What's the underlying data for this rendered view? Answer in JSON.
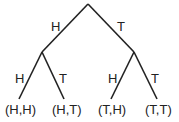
{
  "diagram": {
    "type": "probability-tree",
    "edges": [
      {
        "from": "root",
        "to": "H",
        "label": "H"
      },
      {
        "from": "root",
        "to": "T",
        "label": "T"
      },
      {
        "from": "H",
        "to": "HH",
        "label": "H"
      },
      {
        "from": "H",
        "to": "HT",
        "label": "T"
      },
      {
        "from": "T",
        "to": "TH",
        "label": "H"
      },
      {
        "from": "T",
        "to": "TT",
        "label": "T"
      }
    ],
    "outcomes": [
      "(H,H)",
      "(H,T)",
      "(T,H)",
      "(T,T)"
    ],
    "line_color": "#222222"
  }
}
